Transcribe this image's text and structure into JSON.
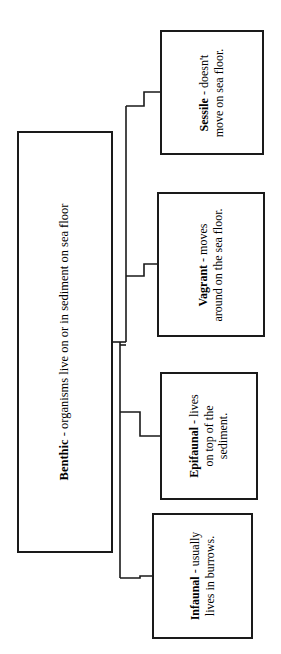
{
  "diagram": {
    "orientation": "rotated-90-ccw",
    "canvas": {
      "width": 281,
      "height": 654
    },
    "line_color": "#1a1a1a",
    "box_border_color": "#1a1a1a",
    "box_fill_color": "#ffffff",
    "background_color": "#ffffff",
    "root": {
      "id": "benthic",
      "term": "Benthic",
      "separator": " - ",
      "definition": "organisms live on or in sediment on sea floor",
      "full_text": "Benthic - organisms live on or in sediment on sea floor",
      "lines": [
        "Benthic - organisms live on or in sediment on sea floor"
      ]
    },
    "children": [
      {
        "id": "sessile",
        "term": "Sessile",
        "separator": " - ",
        "definition": "doesn't move on sea floor.",
        "full_text": "Sessile - doesn't move on sea floor.",
        "lines": [
          "Sessile - doesn't",
          "move on sea floor."
        ]
      },
      {
        "id": "vagrant",
        "term": "Vagrant",
        "separator": " - ",
        "definition": "moves around on the sea floor.",
        "full_text": "Vagrant - moves around on the sea floor.",
        "lines": [
          "Vagrant - moves",
          "around on the sea floor."
        ]
      },
      {
        "id": "epifaunal",
        "term": "Epifaunal",
        "separator": " - ",
        "definition": "lives on top of the sediment.",
        "full_text": "Epifaunal - lives on top of the sediment.",
        "lines": [
          "Epifaunal - lives",
          "on top of the",
          "sediment."
        ]
      },
      {
        "id": "infaunal",
        "term": "Infaunal",
        "separator": " - ",
        "definition": "usually lives in burrows.",
        "full_text": "Infaunal - usually lives in burrows.",
        "lines": [
          "Infaunal - usually",
          "lives in burrows."
        ]
      }
    ]
  }
}
